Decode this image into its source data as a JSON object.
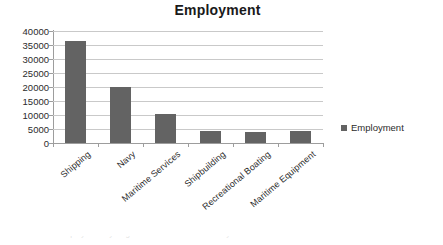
{
  "chart_data": {
    "type": "bar",
    "title": "Employment",
    "xlabel": "",
    "ylabel": "",
    "categories": [
      "Shipping",
      "Navy",
      "Maritime Services",
      "Shipbuilding",
      "Recreational Boating",
      "Maritime Equipment"
    ],
    "values": [
      36500,
      20000,
      10500,
      4200,
      3900,
      4200
    ],
    "series": [
      {
        "name": "Employment",
        "values": [
          36500,
          20000,
          10500,
          4200,
          3900,
          4200
        ]
      }
    ],
    "ylim": [
      0,
      40000
    ],
    "ytick_labels": [
      "40000",
      "35000",
      "30000",
      "25000",
      "20000",
      "15000",
      "10000",
      "5000",
      "0"
    ],
    "ytick_values": [
      40000,
      35000,
      30000,
      25000,
      20000,
      15000,
      10000,
      5000,
      0
    ],
    "grid": true,
    "legend": {
      "position": "right",
      "entries": [
        "Employment"
      ]
    },
    "bar_color": "#636363",
    "grid_color": "#c9c9c9",
    "axis_color": "#9d9d9d",
    "text_color": "#2b2b2b"
  },
  "artifact": {
    "text": "the tops of a cut-off line of text"
  }
}
